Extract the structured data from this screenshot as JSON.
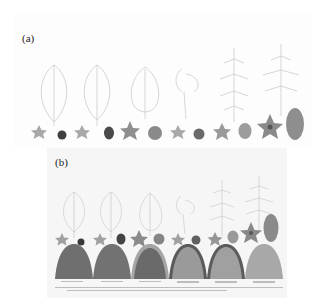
{
  "figure": {
    "panels": [
      {
        "id": "a",
        "label": "(a)",
        "columns": 6,
        "rows": [
          "leaf",
          "flower",
          "fruit"
        ]
      },
      {
        "id": "b",
        "label": "(b)",
        "columns": 6,
        "rows": [
          "leaf",
          "flower",
          "fruit",
          "mound-section"
        ],
        "captions_legible": false
      }
    ],
    "colors": {
      "leaf_outline": "#bdbdbd",
      "flower_fill": "#9a9a9a",
      "fruit_dark": "#4a4a4a",
      "fruit_mid": "#7a7a7a",
      "fruit_light": "#9c9c9c",
      "mound_dark": "#707070",
      "mound_light": "#a8a8a8"
    }
  }
}
